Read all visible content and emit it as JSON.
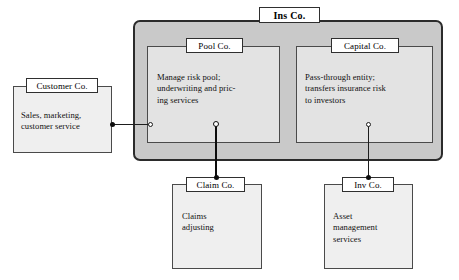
{
  "diagram": {
    "title": "Ins Co.",
    "outer_fill": "#c9c9c9",
    "box_fill": "#efefef",
    "line_color": "#1d1d1d"
  },
  "entities": {
    "ins_co": {
      "label": "Ins Co."
    },
    "pool_co": {
      "label": "Pool Co.",
      "body": "Manage risk pool;\nunderwriting and pric-\ning services"
    },
    "capital_co": {
      "label": "Capital Co.",
      "body": "Pass-through entity;\ntransfers insurance risk\nto investors"
    },
    "customer_co": {
      "label": "Customer Co.",
      "body": "Sales, marketing,\ncustomer service"
    },
    "claim_co": {
      "label": "Claim Co.",
      "body": "Claims\nadjusting"
    },
    "inv_co": {
      "label": "Inv Co.",
      "body": "Asset\nmanagement\nservices"
    }
  },
  "connectors": [
    {
      "name": "customer-to-pool",
      "from": "customer_co",
      "to": "pool_co",
      "from_marker": "filled-dot",
      "to_marker": "hollow-circle",
      "weight": "thin"
    },
    {
      "name": "pool-to-claim",
      "from": "pool_co",
      "to": "claim_co",
      "from_marker": "hollow-circle",
      "to_marker": "filled-dot",
      "weight": "thick"
    },
    {
      "name": "capital-to-inv",
      "from": "capital_co",
      "to": "inv_co",
      "from_marker": "hollow-circle",
      "to_marker": "filled-dot",
      "weight": "thin"
    }
  ]
}
